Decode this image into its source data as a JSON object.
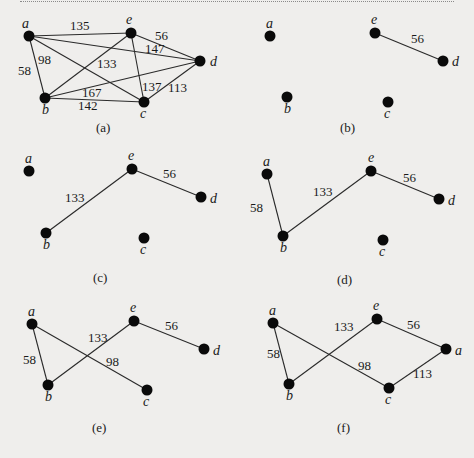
{
  "figure": {
    "colors": {
      "background": "#efeeec",
      "ink": "#1a1a1a",
      "vertex": "#0a0a0a",
      "edge": "#2a2a2a"
    },
    "panels": [
      {
        "id": "a",
        "caption": "(a)",
        "caption_pos": [
          96,
          132
        ],
        "vertices": [
          {
            "name": "a",
            "x": 29,
            "y": 36,
            "lx": 22,
            "ly": 28
          },
          {
            "name": "e",
            "x": 131,
            "y": 33,
            "lx": 126,
            "ly": 24
          },
          {
            "name": "d",
            "x": 200,
            "y": 61,
            "lx": 210,
            "ly": 66
          },
          {
            "name": "b",
            "x": 45,
            "y": 98,
            "lx": 42,
            "ly": 114
          },
          {
            "name": "c",
            "x": 144,
            "y": 102,
            "lx": 140,
            "ly": 118
          }
        ],
        "edges": [
          {
            "from": "a",
            "to": "e",
            "weight": "135",
            "lx": 70,
            "ly": 30
          },
          {
            "from": "a",
            "to": "d",
            "weight": "147",
            "lx": 145,
            "ly": 53
          },
          {
            "from": "a",
            "to": "c",
            "weight": "98",
            "lx": 38,
            "ly": 64
          },
          {
            "from": "a",
            "to": "b",
            "weight": "58",
            "lx": 18,
            "ly": 75
          },
          {
            "from": "e",
            "to": "d",
            "weight": "56",
            "lx": 155,
            "ly": 40
          },
          {
            "from": "e",
            "to": "b",
            "weight": "133",
            "lx": 97,
            "ly": 68
          },
          {
            "from": "e",
            "to": "c",
            "weight": "137",
            "lx": 142,
            "ly": 91
          },
          {
            "from": "b",
            "to": "d",
            "weight": "167",
            "lx": 82,
            "ly": 97
          },
          {
            "from": "b",
            "to": "c",
            "weight": "142",
            "lx": 78,
            "ly": 110
          },
          {
            "from": "c",
            "to": "d",
            "weight": "113",
            "lx": 168,
            "ly": 92
          }
        ]
      },
      {
        "id": "b",
        "caption": "(b)",
        "caption_pos": [
          340,
          132
        ],
        "vertices": [
          {
            "name": "a",
            "x": 270,
            "y": 36,
            "lx": 266,
            "ly": 28
          },
          {
            "name": "e",
            "x": 375,
            "y": 33,
            "lx": 371,
            "ly": 24
          },
          {
            "name": "d",
            "x": 443,
            "y": 61,
            "lx": 452,
            "ly": 66
          },
          {
            "name": "b",
            "x": 287,
            "y": 97,
            "lx": 284,
            "ly": 113
          },
          {
            "name": "c",
            "x": 388,
            "y": 102,
            "lx": 384,
            "ly": 118
          }
        ],
        "edges": [
          {
            "from": "e",
            "to": "d",
            "weight": "56",
            "lx": 411,
            "ly": 43
          }
        ]
      },
      {
        "id": "c",
        "caption": "(c)",
        "caption_pos": [
          93,
          282
        ],
        "vertices": [
          {
            "name": "a",
            "x": 29,
            "y": 171,
            "lx": 25,
            "ly": 163
          },
          {
            "name": "e",
            "x": 132,
            "y": 169,
            "lx": 128,
            "ly": 160
          },
          {
            "name": "d",
            "x": 201,
            "y": 197,
            "lx": 210,
            "ly": 203
          },
          {
            "name": "b",
            "x": 46,
            "y": 233,
            "lx": 43,
            "ly": 249
          },
          {
            "name": "c",
            "x": 144,
            "y": 238,
            "lx": 140,
            "ly": 254
          }
        ],
        "edges": [
          {
            "from": "e",
            "to": "b",
            "weight": "133",
            "lx": 65,
            "ly": 202
          },
          {
            "from": "e",
            "to": "d",
            "weight": "56",
            "lx": 163,
            "ly": 178
          }
        ]
      },
      {
        "id": "d",
        "caption": "(d)",
        "caption_pos": [
          337,
          284
        ],
        "vertices": [
          {
            "name": "a",
            "x": 267,
            "y": 174,
            "lx": 263,
            "ly": 166
          },
          {
            "name": "e",
            "x": 371,
            "y": 171,
            "lx": 368,
            "ly": 162
          },
          {
            "name": "d",
            "x": 439,
            "y": 199,
            "lx": 448,
            "ly": 205
          },
          {
            "name": "b",
            "x": 283,
            "y": 236,
            "lx": 280,
            "ly": 252
          },
          {
            "name": "c",
            "x": 383,
            "y": 240,
            "lx": 379,
            "ly": 256
          }
        ],
        "edges": [
          {
            "from": "a",
            "to": "b",
            "weight": "58",
            "lx": 250,
            "ly": 212
          },
          {
            "from": "b",
            "to": "e",
            "weight": "133",
            "lx": 313,
            "ly": 196
          },
          {
            "from": "e",
            "to": "d",
            "weight": "56",
            "lx": 403,
            "ly": 182
          }
        ]
      },
      {
        "id": "e",
        "caption": "(e)",
        "caption_pos": [
          92,
          432
        ],
        "vertices": [
          {
            "name": "a",
            "x": 32,
            "y": 324,
            "lx": 28,
            "ly": 316
          },
          {
            "name": "e",
            "x": 134,
            "y": 321,
            "lx": 130,
            "ly": 312
          },
          {
            "name": "d",
            "x": 204,
            "y": 349,
            "lx": 213,
            "ly": 355
          },
          {
            "name": "b",
            "x": 48,
            "y": 385,
            "lx": 45,
            "ly": 401
          },
          {
            "name": "c",
            "x": 147,
            "y": 390,
            "lx": 143,
            "ly": 406
          }
        ],
        "edges": [
          {
            "from": "a",
            "to": "b",
            "weight": "58",
            "lx": 23,
            "ly": 364
          },
          {
            "from": "b",
            "to": "e",
            "weight": "133",
            "lx": 88,
            "ly": 342
          },
          {
            "from": "a",
            "to": "c",
            "weight": "98",
            "lx": 106,
            "ly": 366
          },
          {
            "from": "e",
            "to": "d",
            "weight": "56",
            "lx": 165,
            "ly": 330
          }
        ]
      },
      {
        "id": "f",
        "caption": "(f)",
        "caption_pos": [
          337,
          432
        ],
        "vertices": [
          {
            "name": "a",
            "x": 273,
            "y": 323,
            "lx": 269,
            "ly": 315
          },
          {
            "name": "e",
            "x": 377,
            "y": 319,
            "lx": 373,
            "ly": 310
          },
          {
            "name": "a",
            "x": 446,
            "y": 349,
            "lx": 455,
            "ly": 355
          },
          {
            "name": "b",
            "x": 289,
            "y": 384,
            "lx": 286,
            "ly": 400
          },
          {
            "name": "c",
            "x": 389,
            "y": 388,
            "lx": 385,
            "ly": 404
          }
        ],
        "edges": [
          {
            "from": 0,
            "to": 3,
            "weight": "58",
            "lx": 267,
            "ly": 358
          },
          {
            "from": 3,
            "to": 1,
            "weight": "133",
            "lx": 334,
            "ly": 331
          },
          {
            "from": 0,
            "to": 4,
            "weight": "98",
            "lx": 358,
            "ly": 370
          },
          {
            "from": 1,
            "to": 2,
            "weight": "56",
            "lx": 407,
            "ly": 329
          },
          {
            "from": 4,
            "to": 2,
            "weight": "113",
            "lx": 413,
            "ly": 378
          }
        ]
      }
    ]
  }
}
